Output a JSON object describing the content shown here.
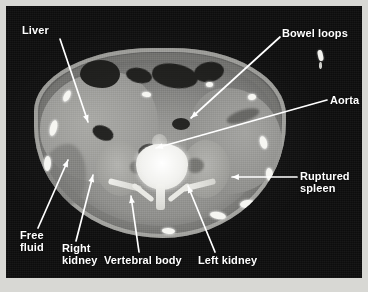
{
  "figure": {
    "kind": "axial-ct-abdomen",
    "border_color": "#d8d8d4",
    "background_color": "#0d0d0d",
    "label_color": "#ffffff"
  },
  "annotations": [
    {
      "id": "liver",
      "label": "Liver",
      "label_x": 22,
      "label_y": 24,
      "arrow_from": [
        60,
        39
      ],
      "arrow_to": [
        88,
        122
      ]
    },
    {
      "id": "bowel-loops",
      "label": "Bowel loops",
      "label_x": 282,
      "label_y": 27,
      "arrow_from": [
        280,
        37
      ],
      "arrow_to": [
        191,
        118
      ]
    },
    {
      "id": "aorta",
      "label": "Aorta",
      "label_x": 330,
      "label_y": 94,
      "arrow_from": [
        327,
        100
      ],
      "arrow_to": [
        156,
        148
      ]
    },
    {
      "id": "ruptured-spleen",
      "label": "Ruptured\nspleen",
      "label_x": 300,
      "label_y": 170,
      "arrow_from": [
        297,
        177
      ],
      "arrow_to": [
        232,
        177
      ]
    },
    {
      "id": "free-fluid",
      "label": "Free\nfluid",
      "label_x": 20,
      "label_y": 229,
      "arrow_from": [
        38,
        228
      ],
      "arrow_to": [
        68,
        160
      ]
    },
    {
      "id": "right-kidney",
      "label": "Right\nkidney",
      "label_x": 62,
      "label_y": 242,
      "arrow_from": [
        76,
        241
      ],
      "arrow_to": [
        93,
        175
      ]
    },
    {
      "id": "vertebral-body",
      "label": "Vertebral body",
      "label_x": 104,
      "label_y": 254,
      "arrow_from": [
        139,
        252
      ],
      "arrow_to": [
        131,
        196
      ]
    },
    {
      "id": "left-kidney",
      "label": "Left kidney",
      "label_x": 198,
      "label_y": 254,
      "arrow_from": [
        215,
        252
      ],
      "arrow_to": [
        188,
        186
      ]
    }
  ]
}
